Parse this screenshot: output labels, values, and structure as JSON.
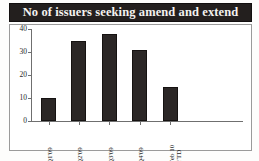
{
  "figure": {
    "title": "No of issuers seeking amend and extend",
    "source_note": "Source: S&P/Leveraged Commentary and Data and LCDNews",
    "colors": {
      "title_bar_background": "#231f1e",
      "title_text": "#f4f2ef",
      "bar_fill": "#2b2726",
      "axis": "#6f6f6f",
      "plot_background": "#ffffff",
      "frame_border": "#9a9a9a"
    }
  },
  "chart_data": {
    "type": "bar",
    "title": "No of issuers seeking amend and extend",
    "xlabel": "",
    "ylabel": "",
    "categories": [
      "Q1'09",
      "Q2'09",
      "Q3'09",
      "Q4'09",
      "Feb 10 YTD"
    ],
    "category_lines": [
      [
        "Q1'09"
      ],
      [
        "Q2'09"
      ],
      [
        "Q3'09"
      ],
      [
        "Q4'09"
      ],
      [
        "Feb 10",
        "YTD"
      ]
    ],
    "values": [
      10,
      35,
      38,
      31,
      15
    ],
    "ylim": [
      0,
      40
    ],
    "yticks": [
      0,
      10,
      20,
      30,
      40
    ],
    "ytick_labels": [
      "0",
      "10",
      "20",
      "30",
      "40"
    ],
    "grid": false,
    "legend": null
  }
}
